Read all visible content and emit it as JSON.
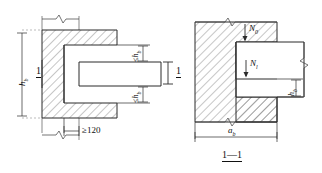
{
  "drawing": {
    "title": "Beam-to-wall pocket connection detail",
    "line_color": "#2b2b2b",
    "hatch_color": "#5a5a5a",
    "background": "#ffffff"
  },
  "left_figure": {
    "name": "plan-view",
    "section_marker": "1",
    "dim_left": {
      "value": "h",
      "sub": "b"
    },
    "dim_top_right": {
      "prefix": "≤",
      "value": "h",
      "sub": "b"
    },
    "dim_bottom_right": {
      "prefix": "≤",
      "value": "h",
      "sub": "b"
    },
    "dim_bottom": "≥120"
  },
  "right_figure": {
    "name": "section-view",
    "caption": "1—1",
    "section_marker": "1",
    "load_upper": {
      "value": "N",
      "sub": "0"
    },
    "load_lower": {
      "value": "N",
      "sub": "l"
    },
    "dim_right": {
      "value": "h",
      "sub": "b"
    },
    "dim_bottom": {
      "value": "a",
      "sub": "b"
    }
  }
}
